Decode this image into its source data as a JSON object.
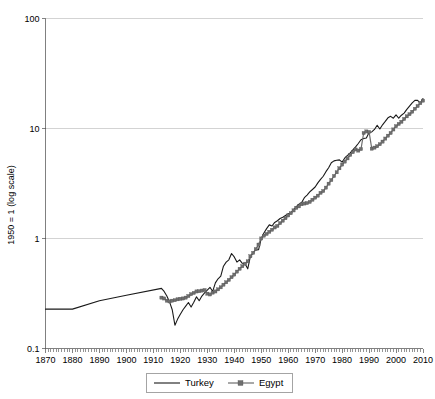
{
  "chart_data": {
    "type": "line",
    "title": "",
    "subtitle": "",
    "xlabel": "",
    "ylabel": "1950 = 1 (log scale)",
    "y_scale": "log",
    "ylim": [
      0.1,
      100
    ],
    "xlim": [
      1870,
      2010
    ],
    "y_ticks": [
      "0.1",
      "1",
      "10",
      "100"
    ],
    "y_tick_values": [
      0.1,
      1,
      10,
      100
    ],
    "x_ticks": [
      "1870",
      "1880",
      "1890",
      "1900",
      "1910",
      "1920",
      "1930",
      "1940",
      "1950",
      "1960",
      "1970",
      "1980",
      "1990",
      "2000",
      "2010"
    ],
    "x_tick_values": [
      1870,
      1880,
      1890,
      1900,
      1910,
      1920,
      1930,
      1940,
      1950,
      1960,
      1970,
      1980,
      1990,
      2000,
      2010
    ],
    "grid": "horizontal",
    "legend_position": "bottom",
    "colors": {
      "turkey": "#1a1a1a",
      "egypt": "#6e6e6e",
      "gridline": "#c8c8c8",
      "axis": "#808080",
      "background": "#ffffff"
    },
    "series": [
      {
        "name": "Turkey",
        "marker": "none",
        "x": [
          1870,
          1880,
          1890,
          1900,
          1913,
          1914,
          1915,
          1916,
          1917,
          1918,
          1919,
          1920,
          1921,
          1922,
          1923,
          1924,
          1925,
          1926,
          1927,
          1928,
          1929,
          1930,
          1931,
          1932,
          1933,
          1934,
          1935,
          1936,
          1937,
          1938,
          1939,
          1940,
          1941,
          1942,
          1943,
          1944,
          1945,
          1946,
          1947,
          1948,
          1949,
          1950,
          1951,
          1952,
          1953,
          1954,
          1955,
          1956,
          1957,
          1958,
          1959,
          1960,
          1961,
          1962,
          1963,
          1964,
          1965,
          1966,
          1967,
          1968,
          1969,
          1970,
          1971,
          1972,
          1973,
          1974,
          1975,
          1976,
          1977,
          1978,
          1979,
          1980,
          1981,
          1982,
          1983,
          1984,
          1985,
          1986,
          1987,
          1988,
          1989,
          1990,
          1991,
          1992,
          1993,
          1994,
          1995,
          1996,
          1997,
          1998,
          1999,
          2000,
          2001,
          2002,
          2003,
          2004,
          2005,
          2006,
          2007,
          2008,
          2009,
          2010
        ],
        "y": [
          0.228,
          0.228,
          0.272,
          0.305,
          0.352,
          0.33,
          0.3,
          0.265,
          0.225,
          0.163,
          0.185,
          0.205,
          0.225,
          0.243,
          0.262,
          0.238,
          0.263,
          0.295,
          0.272,
          0.3,
          0.32,
          0.34,
          0.36,
          0.33,
          0.395,
          0.43,
          0.455,
          0.56,
          0.61,
          0.64,
          0.73,
          0.68,
          0.61,
          0.64,
          0.595,
          0.59,
          0.53,
          0.69,
          0.74,
          0.79,
          0.79,
          1.0,
          1.12,
          1.23,
          1.33,
          1.3,
          1.4,
          1.45,
          1.52,
          1.56,
          1.62,
          1.68,
          1.7,
          1.83,
          1.95,
          2.05,
          2.12,
          2.35,
          2.48,
          2.65,
          2.79,
          2.94,
          3.2,
          3.45,
          3.68,
          4.05,
          4.4,
          4.88,
          5.08,
          5.15,
          5.18,
          4.95,
          5.4,
          5.7,
          6.0,
          6.4,
          6.8,
          7.3,
          7.9,
          8.1,
          8.2,
          9.2,
          9.3,
          9.8,
          10.7,
          9.9,
          10.8,
          11.6,
          12.5,
          12.9,
          12.4,
          13.3,
          12.4,
          13.2,
          13.8,
          14.9,
          16.0,
          17.1,
          18.0,
          18.0,
          17.0,
          18.7
        ]
      },
      {
        "name": "Egypt",
        "marker": "square",
        "x": [
          1913,
          1914,
          1915,
          1916,
          1917,
          1918,
          1919,
          1920,
          1921,
          1922,
          1923,
          1924,
          1925,
          1926,
          1927,
          1928,
          1929,
          1930,
          1931,
          1932,
          1933,
          1934,
          1935,
          1936,
          1937,
          1938,
          1939,
          1940,
          1941,
          1942,
          1943,
          1944,
          1945,
          1946,
          1947,
          1948,
          1949,
          1950,
          1951,
          1952,
          1953,
          1954,
          1955,
          1956,
          1957,
          1958,
          1959,
          1960,
          1961,
          1962,
          1963,
          1964,
          1965,
          1966,
          1967,
          1968,
          1969,
          1970,
          1971,
          1972,
          1973,
          1974,
          1975,
          1976,
          1977,
          1978,
          1979,
          1980,
          1981,
          1982,
          1983,
          1984,
          1985,
          1986,
          1987,
          1988,
          1989,
          1990,
          1991,
          1992,
          1993,
          1994,
          1995,
          1996,
          1997,
          1998,
          1999,
          2000,
          2001,
          2002,
          2003,
          2004,
          2005,
          2006,
          2007,
          2008,
          2009,
          2010
        ],
        "y": [
          0.29,
          0.285,
          0.272,
          0.268,
          0.272,
          0.275,
          0.28,
          0.283,
          0.285,
          0.29,
          0.3,
          0.312,
          0.32,
          0.33,
          0.332,
          0.336,
          0.34,
          0.315,
          0.31,
          0.322,
          0.33,
          0.345,
          0.36,
          0.38,
          0.4,
          0.42,
          0.445,
          0.47,
          0.5,
          0.53,
          0.56,
          0.59,
          0.62,
          0.69,
          0.74,
          0.8,
          0.88,
          1.0,
          1.06,
          1.1,
          1.15,
          1.2,
          1.26,
          1.3,
          1.38,
          1.45,
          1.53,
          1.62,
          1.7,
          1.8,
          1.9,
          1.96,
          2.05,
          2.08,
          2.1,
          2.15,
          2.25,
          2.35,
          2.45,
          2.6,
          2.7,
          2.9,
          3.15,
          3.4,
          3.7,
          4.0,
          4.35,
          4.7,
          5.0,
          5.35,
          5.75,
          6.1,
          6.45,
          6.3,
          6.5,
          9.1,
          9.4,
          9.3,
          6.55,
          6.7,
          6.9,
          7.2,
          7.6,
          8.1,
          8.6,
          9.1,
          9.8,
          10.5,
          11.0,
          11.5,
          12.2,
          12.9,
          13.5,
          14.2,
          15.1,
          16.0,
          17.0,
          17.9
        ]
      }
    ]
  },
  "legend": {
    "items": [
      {
        "label": "Turkey",
        "style": "line"
      },
      {
        "label": "Egypt",
        "style": "line-marker"
      }
    ]
  }
}
